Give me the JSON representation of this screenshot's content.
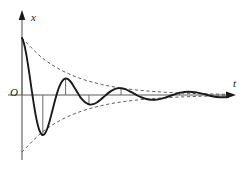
{
  "figure": {
    "axes": {
      "vertical_label": "x",
      "horizontal_label": "t",
      "origin_label": "O"
    },
    "colors": {
      "curve": "#1a1a1a",
      "envelope": "#4d4d4d",
      "axis": "#4d4d4d",
      "tick": "#6b6b6b",
      "background": "#ffffff"
    }
  },
  "chart_data": {
    "type": "line",
    "xlabel": "t",
    "ylabel": "x",
    "grid": false,
    "legend": null,
    "xlim": [
      0,
      10.4
    ],
    "ylim": [
      -1.15,
      1.15
    ],
    "origin_label": "O",
    "equation": "x = A0 * exp(-b*t) * cos(w*t)",
    "parameters": {
      "A0": 1.0,
      "decay": 0.42,
      "omega": 3.32,
      "phase": 0.0
    },
    "series": [
      {
        "name": "displacement",
        "style": "solid",
        "x": [
          0.0,
          0.1,
          0.2,
          0.3,
          0.4,
          0.5,
          0.6,
          0.7,
          0.8,
          0.9,
          1.0,
          1.1,
          1.2,
          1.3,
          1.4,
          1.5,
          1.6,
          1.7,
          1.8,
          1.9,
          2.0,
          2.1,
          2.2,
          2.3,
          2.4,
          2.5,
          2.6,
          2.7,
          2.8,
          2.9,
          3.0,
          3.2,
          3.4,
          3.6,
          3.8,
          4.0,
          4.2,
          4.4,
          4.6,
          4.8,
          5.0,
          5.2,
          5.4,
          5.6,
          5.8,
          6.0,
          6.4,
          6.8,
          7.2,
          7.6,
          8.0,
          8.4,
          8.8,
          9.2,
          9.6,
          10.0,
          10.4
        ],
        "y": [
          1.0,
          0.903,
          0.744,
          0.537,
          0.302,
          0.06,
          -0.169,
          -0.37,
          -0.53,
          -0.64,
          -0.696,
          -0.698,
          -0.652,
          -0.566,
          -0.451,
          -0.319,
          -0.183,
          -0.052,
          0.064,
          0.159,
          0.229,
          0.272,
          0.289,
          0.282,
          0.255,
          0.212,
          0.159,
          0.101,
          0.042,
          -0.013,
          -0.062,
          -0.133,
          -0.166,
          -0.161,
          -0.126,
          -0.072,
          -0.011,
          0.046,
          0.09,
          0.115,
          0.119,
          0.104,
          0.074,
          0.036,
          -0.004,
          -0.039,
          -0.08,
          -0.082,
          -0.049,
          0.0,
          0.041,
          0.058,
          0.046,
          0.014,
          -0.021,
          -0.04,
          -0.036
        ]
      },
      {
        "name": "upper-envelope",
        "style": "dashed",
        "x": [
          0.0,
          1.0,
          2.0,
          3.0,
          4.0,
          5.0,
          6.0,
          7.0,
          8.0,
          9.0,
          10.0,
          10.4
        ],
        "y": [
          1.0,
          0.657,
          0.432,
          0.284,
          0.187,
          0.122,
          0.081,
          0.053,
          0.035,
          0.023,
          0.015,
          0.013
        ]
      },
      {
        "name": "lower-envelope",
        "style": "dashed",
        "x": [
          0.0,
          1.0,
          2.0,
          3.0,
          4.0,
          5.0,
          6.0,
          7.0,
          8.0,
          9.0,
          10.0,
          10.4
        ],
        "y": [
          -1.0,
          -0.657,
          -0.432,
          -0.284,
          -0.187,
          -0.122,
          -0.081,
          -0.053,
          -0.035,
          -0.023,
          -0.015,
          -0.013
        ]
      }
    ],
    "extrema_ticks": [
      {
        "name": "peak-1",
        "x": 0.0,
        "y": 1.0
      },
      {
        "name": "trough-1",
        "x": 1.05,
        "y": -0.698
      },
      {
        "name": "peak-2",
        "x": 2.2,
        "y": 0.289
      },
      {
        "name": "trough-2",
        "x": 3.38,
        "y": -0.167
      },
      {
        "name": "peak-3",
        "x": 5.0,
        "y": 0.119
      },
      {
        "name": "peak-4",
        "x": 7.95,
        "y": 0.058
      }
    ]
  }
}
